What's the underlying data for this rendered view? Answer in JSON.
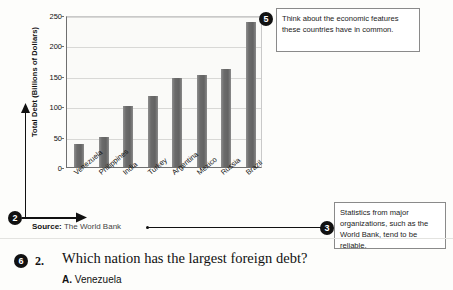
{
  "chart_data": {
    "type": "bar",
    "title": "",
    "xlabel": "",
    "ylabel": "Total Debt (Billions of Dollars)",
    "ylim": [
      0,
      250
    ],
    "yticks": [
      0,
      50,
      100,
      150,
      200,
      250
    ],
    "grid": true,
    "legend": "none",
    "categories": [
      "Venezuela",
      "Philippines",
      "India",
      "Turkey",
      "Argentina",
      "Mexico",
      "Russia",
      "Brazil"
    ],
    "values": [
      38,
      50,
      100,
      116,
      147,
      151,
      161,
      238
    ],
    "bar_color": "#6b6b6b",
    "source": "The World Bank"
  },
  "source": {
    "label": "Source:",
    "value": " The World Bank"
  },
  "callouts": [
    {
      "number": "2",
      "text": ""
    },
    {
      "number": "3",
      "text": "Statistics from major organizations, such as the World Bank, tend to be reliable."
    },
    {
      "number": "5",
      "text": "Think about the economic features these countries have in common."
    },
    {
      "number": "6",
      "text": ""
    }
  ],
  "question": {
    "marker": "6",
    "number": "2.",
    "text": "Which nation has the largest foreign debt?",
    "choices": [
      {
        "letter": "A.",
        "label": "Venezuela"
      }
    ]
  }
}
